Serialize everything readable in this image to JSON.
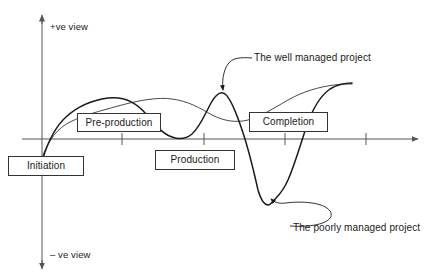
{
  "diagram": {
    "axes": {
      "vertical": {
        "positive_label": "+ve view",
        "negative_label": "– ve view",
        "x": 42,
        "top_y": 14,
        "bottom_y": 270
      },
      "horizontal": {
        "y": 139,
        "start_x": 22,
        "end_x": 420,
        "ticks": [
          122,
          204,
          285,
          366
        ]
      },
      "color": "#555555"
    },
    "phase_boxes": [
      {
        "id": "initiation",
        "label": "Initiation"
      },
      {
        "id": "preproduction",
        "label": "Pre-production"
      },
      {
        "id": "production",
        "label": "Production"
      },
      {
        "id": "completion",
        "label": "Completion"
      }
    ],
    "callouts": [
      {
        "id": "well-managed",
        "label": "The well managed project"
      },
      {
        "id": "poorly-managed",
        "label": "The poorly managed project"
      }
    ],
    "curves": [
      {
        "id": "well-managed-curve",
        "name": "The well managed project",
        "stroke": "#333333",
        "stroke_width": 0.9,
        "path": "M 43,155 C 50,138 58,128 70,122 C 84,115 100,111 118,106 C 140,100 158,97 172,99 C 188,101 200,108 212,115 C 224,121 236,123 248,120 C 262,116 274,108 288,100 C 302,92 318,87 334,85 C 342,84 348,84 352,84"
      },
      {
        "id": "poorly-managed-curve",
        "name": "The poorly managed project",
        "stroke": "#1a1a1a",
        "stroke_width": 1.5,
        "path": "M 43,158 C 48,142 55,127 66,117 C 78,106 93,100 108,98 C 124,96 136,102 146,114 C 156,126 163,134 172,137 C 180,140 186,139 192,134 C 200,127 205,114 211,103 C 215,96 219,92 223,93 C 228,94 233,104 240,124 C 248,146 254,172 258,190 C 261,200 264,205 268,205 C 271,205 273,201 276,198 C 280,194 284,189 288,180 C 295,164 300,146 306,128 C 312,110 320,96 330,89 C 338,84 346,83 352,83"
      }
    ],
    "leaders": [
      {
        "id": "well-managed-leader",
        "path": "M 252,58 C 240,57 232,58 228,64 C 223,71 222,82 223,90",
        "arrow_at": {
          "x": 223,
          "y": 93,
          "angle": 100
        }
      },
      {
        "id": "poorly-managed-leader",
        "path": "M 290,226 C 320,228 336,220 330,211 C 324,202 300,201 286,203 C 278,204 274,202 271,199",
        "arrow_at": {
          "x": 269,
          "y": 197,
          "angle": 228
        }
      }
    ]
  }
}
